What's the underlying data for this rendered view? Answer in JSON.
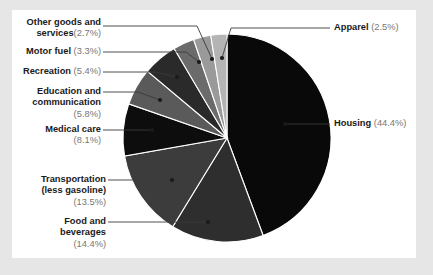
{
  "chart_data": {
    "type": "pie",
    "title": "",
    "categories": [
      "Housing",
      "Food and beverages",
      "Transportation (less gasoline)",
      "Medical care",
      "Education and communication",
      "Recreation",
      "Motor fuel",
      "Other goods and services",
      "Apparel"
    ],
    "values": [
      44.4,
      14.4,
      13.5,
      8.1,
      5.8,
      5.4,
      3.3,
      2.7,
      2.5
    ],
    "unit": "%",
    "legend_position": "callout-labels",
    "grid": false,
    "start_angle_deg": 0,
    "direction": "clockwise",
    "slice_colors": [
      "#090909",
      "#2e2e2e",
      "#3c3c3c",
      "#0d0d0d",
      "#5a5a5a",
      "#2a2a2a",
      "#6b6b6b",
      "#9a9a9a",
      "#b4b4b4"
    ]
  },
  "colors": {
    "page_background": "#e6e6e6",
    "card_background": "#ffffff",
    "label_text": "#1a1a1a",
    "percent_text": "#777777",
    "leader_line": "#3a3a3a",
    "slice_separator": "#ffffff"
  },
  "labels": {
    "other_goods": {
      "line1": "Other goods and",
      "line2_cat": "services",
      "line2_pct": "(2.7%)"
    },
    "motor_fuel": {
      "cat": "Motor fuel",
      "pct": "(3.3%)"
    },
    "recreation": {
      "cat": "Recreation",
      "pct": "(5.4%)"
    },
    "education": {
      "line1": "Education and",
      "line2": "communication",
      "line3_pct": "(5.8%)"
    },
    "medical_care": {
      "cat": "Medical care",
      "pct": "(8.1%)"
    },
    "transportation": {
      "line1": "Transportation",
      "line2": "(less gasoline)",
      "line3_pct": "(13.5%)"
    },
    "food_beverages": {
      "line1": "Food and",
      "line2": "beverages",
      "line3_pct": "(14.4%)"
    },
    "apparel": {
      "cat": "Apparel",
      "pct": "(2.5%)"
    },
    "housing": {
      "cat": "Housing",
      "pct": "(44.4%)"
    }
  }
}
